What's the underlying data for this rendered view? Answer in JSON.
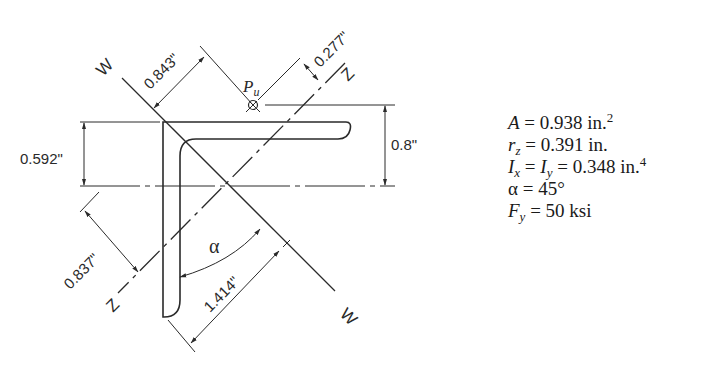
{
  "diagram": {
    "type": "angle-section-geometry",
    "axes": {
      "w_label": "W",
      "z_label": "Z"
    },
    "load_label_main": "P",
    "load_label_sub": "u",
    "angle_label": "α",
    "dimensions": {
      "d_w_to_load": "0.843\"",
      "d_z_to_load": "0.277\"",
      "d_top_to_centroid": "0.592\"",
      "d_load_to_centroid": "0.8\"",
      "d_z_to_heel": "0.837\"",
      "d_w_to_toe": "1.414\""
    }
  },
  "properties": [
    {
      "sym": "A",
      "sub": "",
      "eq": "= 0.938 in.",
      "sup": "2"
    },
    {
      "sym": "r",
      "sub": "z",
      "eq": "= 0.391 in.",
      "sup": ""
    },
    {
      "sym": "I",
      "sub": "x",
      "eq": " = ",
      "sym2": "I",
      "sub2": "y",
      "eq2": "= 0.348 in.",
      "sup": "4"
    },
    {
      "sym": "α",
      "sub": "",
      "eq": " = 45°",
      "sup": ""
    },
    {
      "sym": "F",
      "sub": "y",
      "eq": "= 50 ksi",
      "sup": ""
    }
  ],
  "colors": {
    "line": "#2a2a2a",
    "background": "#ffffff"
  }
}
